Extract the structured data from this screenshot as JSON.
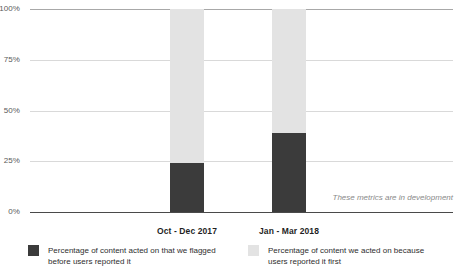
{
  "chart_data": {
    "type": "bar",
    "subtype": "stacked-bar-100-percent",
    "title": "",
    "subtitle": "",
    "xlabel": "",
    "ylabel": "",
    "categories": [
      "Oct - Dec 2017",
      "Jan - Mar 2018"
    ],
    "series": [
      {
        "name": "Percentage of content acted on that we flagged before users reported it",
        "color": "#3b3b3b",
        "values": [
          24,
          39
        ]
      },
      {
        "name": "Percentage of content we acted on because users reported it first",
        "color": "#e3e3e3",
        "values": [
          76,
          61
        ]
      }
    ],
    "ylim": [
      0,
      100
    ],
    "yticks": [
      "0%",
      "25%",
      "50%",
      "75%",
      "100%"
    ],
    "ytick_values": [
      0,
      25,
      50,
      75,
      100
    ],
    "grid": true,
    "legend_position": "bottom",
    "annotations": [
      "These metrics are in development"
    ]
  },
  "axis": {
    "y": {
      "ticks": [
        {
          "label": "100%",
          "value": 100
        },
        {
          "label": "75%",
          "value": 75
        },
        {
          "label": "50%",
          "value": 50
        },
        {
          "label": "25%",
          "value": 25
        },
        {
          "label": "0%",
          "value": 0
        }
      ]
    },
    "x": {
      "ticks": [
        {
          "label": "Oct - Dec 2017"
        },
        {
          "label": "Jan - Mar 2018"
        }
      ]
    }
  },
  "bars": [
    {
      "category": "Oct - Dec 2017",
      "light_pct": 76,
      "dark_pct": 24,
      "left_px": 140,
      "width_px": 34
    },
    {
      "category": "Jan - Mar 2018",
      "light_pct": 61,
      "dark_pct": 39,
      "left_px": 242,
      "width_px": 34
    }
  ],
  "legend": {
    "entries": [
      {
        "swatch": "dark",
        "color": "#3b3b3b",
        "label": "Percentage of content acted on that we flagged before users reported it"
      },
      {
        "swatch": "light",
        "color": "#e3e3e3",
        "label": "Percentage of content we acted on because users reported it first"
      }
    ]
  },
  "annotation": {
    "text": "These metrics are in development"
  },
  "colors": {
    "series_dark": "#3b3b3b",
    "series_light": "#e3e3e3",
    "gridline": "#d9d9d9",
    "axis": "#4a4a4a",
    "tick_text": "#5a5a5a",
    "annotation_text": "#8a8a8a",
    "background": "#ffffff"
  }
}
